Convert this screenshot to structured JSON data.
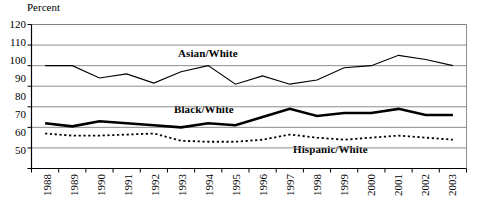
{
  "chart_data": {
    "type": "line",
    "title": "",
    "subtitle": "",
    "xlabel": "",
    "ylabel": "Percent",
    "ylim": [
      50,
      120
    ],
    "yticks": [
      50,
      60,
      70,
      80,
      90,
      100,
      110,
      120
    ],
    "grid": true,
    "legend_position": "inline-annotations",
    "x": [
      "1988",
      "1989",
      "1990",
      "1991",
      "1992",
      "1993",
      "1994",
      "1995",
      "1996",
      "1997",
      "1998",
      "1999",
      "2000",
      "2001",
      "2002",
      "2003"
    ],
    "categories": [
      "1988",
      "1989",
      "1990",
      "1991",
      "1992",
      "1993",
      "1994",
      "1995",
      "1996",
      "1997",
      "1998",
      "1999",
      "2000",
      "2001",
      "2002",
      "2003"
    ],
    "series": [
      {
        "name": "Asian/White",
        "style": "thin-solid",
        "color": "#000000",
        "values": [
          100,
          100,
          94,
          96,
          91.5,
          97,
          100,
          91,
          95,
          91,
          93,
          99,
          100,
          105,
          103,
          100
        ]
      },
      {
        "name": "Black/White",
        "style": "thick-solid",
        "color": "#000000",
        "values": [
          72,
          70.5,
          73,
          72,
          71,
          70,
          72,
          71,
          75,
          79,
          75.5,
          77,
          77,
          79,
          76,
          76
        ]
      },
      {
        "name": "Hispanic/White",
        "style": "dotted",
        "color": "#000000",
        "values": [
          67,
          66,
          66,
          66.5,
          67,
          63.5,
          63,
          63,
          64,
          66.5,
          65,
          64,
          65,
          66,
          65,
          64
        ]
      }
    ],
    "annotations": [
      {
        "text": "Asian/White",
        "x_px": 178,
        "y_px": 48
      },
      {
        "text": "Black/White",
        "x_px": 174,
        "y_px": 104
      },
      {
        "text": "Hispanic/White",
        "x_px": 293,
        "y_px": 144
      }
    ]
  },
  "axis": {
    "unit_label": "Percent",
    "y_labels": [
      "120",
      "110",
      "100",
      "90",
      "80",
      "70",
      "60",
      "50"
    ],
    "x_labels": [
      "1988",
      "1989",
      "1990",
      "1991",
      "1992",
      "1993",
      "1994",
      "1995",
      "1996",
      "1997",
      "1998",
      "1999",
      "2000",
      "2001",
      "2002",
      "2003"
    ]
  },
  "colors": {
    "grid": "#808080",
    "axis": "#000000",
    "plot_background": "#ffffff",
    "line": "#000000"
  }
}
